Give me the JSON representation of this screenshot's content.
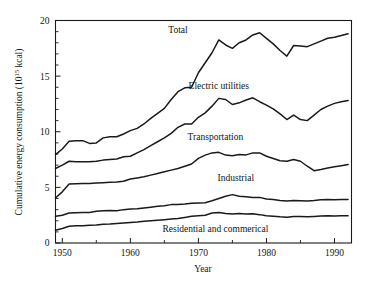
{
  "chart_data": {
    "type": "line",
    "title": "",
    "subtitle": "",
    "xlabel": "Year",
    "ylabel": "Cumulative energy consumption (10",
    "ylabel_exponent": "15",
    "ylabel_suffix": " kcal)",
    "ylabel_full": "Cumulative energy consumption (10^15 kcal)",
    "xlim": [
      1949,
      1992.5
    ],
    "ylim": [
      0,
      20
    ],
    "xticks": [
      1950,
      1960,
      1970,
      1980,
      1990
    ],
    "xtick_labels": [
      "1950",
      "1960",
      "1970",
      "1980",
      "1990"
    ],
    "xticks_minor": [
      1955,
      1965,
      1975,
      1985
    ],
    "yticks": [
      0,
      5,
      10,
      15,
      20
    ],
    "ytick_labels": [
      "0",
      "5",
      "10",
      "15",
      "20"
    ],
    "yticks_minor": [
      1,
      2,
      3,
      4,
      6,
      7,
      8,
      9,
      11,
      12,
      13,
      14,
      16,
      17,
      18,
      19
    ],
    "grid": false,
    "legend_position": "inline-annotations",
    "stacking": "cumulative",
    "line_color": "#1a1a1a",
    "x": [
      1949,
      1950,
      1951,
      1952,
      1953,
      1954,
      1955,
      1956,
      1957,
      1958,
      1959,
      1960,
      1961,
      1962,
      1963,
      1964,
      1965,
      1966,
      1967,
      1968,
      1969,
      1970,
      1971,
      1972,
      1973,
      1974,
      1975,
      1976,
      1977,
      1978,
      1979,
      1980,
      1981,
      1982,
      1983,
      1984,
      1985,
      1986,
      1987,
      1988,
      1989,
      1990,
      1991,
      1992
    ],
    "series": [
      {
        "name": "Residential and commerical",
        "label": "Residential and commerical",
        "label_x": 1972.5,
        "label_y": 1.0,
        "values": [
          1.15,
          1.3,
          1.5,
          1.55,
          1.55,
          1.6,
          1.62,
          1.68,
          1.7,
          1.75,
          1.8,
          1.85,
          1.88,
          1.95,
          2.0,
          2.05,
          2.1,
          2.15,
          2.2,
          2.3,
          2.4,
          2.45,
          2.5,
          2.7,
          2.75,
          2.65,
          2.6,
          2.65,
          2.6,
          2.62,
          2.55,
          2.45,
          2.4,
          2.35,
          2.32,
          2.38,
          2.38,
          2.35,
          2.38,
          2.42,
          2.45,
          2.42,
          2.45,
          2.45
        ]
      },
      {
        "name": "Industrial",
        "label": "Industrial",
        "label_x": 1975.5,
        "label_y": 5.6,
        "values": [
          2.4,
          2.5,
          2.7,
          2.72,
          2.75,
          2.75,
          2.85,
          2.9,
          2.92,
          2.9,
          3.0,
          3.05,
          3.08,
          3.15,
          3.22,
          3.3,
          3.35,
          3.45,
          3.45,
          3.5,
          3.58,
          3.6,
          3.62,
          3.8,
          4.0,
          4.2,
          4.35,
          4.2,
          4.15,
          4.1,
          4.1,
          3.95,
          3.9,
          3.82,
          3.78,
          3.82,
          3.8,
          3.78,
          3.82,
          3.88,
          3.9,
          3.88,
          3.9,
          3.92
        ]
      },
      {
        "name": "Transportation",
        "label": "Transportation",
        "label_x": 1972.5,
        "label_y": 9.3,
        "values": [
          4.05,
          4.6,
          5.3,
          5.32,
          5.35,
          5.35,
          5.4,
          5.42,
          5.45,
          5.48,
          5.55,
          5.75,
          5.85,
          5.95,
          6.1,
          6.25,
          6.4,
          6.55,
          6.7,
          6.9,
          7.1,
          7.6,
          7.9,
          8.1,
          8.15,
          7.9,
          7.85,
          7.95,
          7.92,
          8.1,
          8.1,
          7.8,
          7.6,
          7.4,
          7.35,
          7.5,
          7.35,
          6.9,
          6.5,
          6.6,
          6.75,
          6.85,
          6.95,
          7.05
        ]
      },
      {
        "name": "Electric utilities",
        "label": "Electric utilities",
        "label_x": 1973.0,
        "label_y": 13.8,
        "values": [
          6.7,
          7.0,
          7.35,
          7.3,
          7.3,
          7.3,
          7.35,
          7.45,
          7.5,
          7.55,
          7.75,
          7.8,
          8.1,
          8.4,
          8.75,
          9.1,
          9.45,
          9.85,
          10.4,
          10.7,
          10.7,
          11.3,
          11.7,
          12.3,
          13.0,
          12.9,
          12.45,
          12.6,
          12.85,
          13.05,
          12.7,
          12.4,
          12.05,
          11.6,
          11.1,
          11.5,
          11.1,
          11.0,
          11.5,
          12.0,
          12.3,
          12.55,
          12.7,
          12.8
        ]
      },
      {
        "name": "Total",
        "label": "Total",
        "label_x": 1967.0,
        "label_y": 18.9,
        "values": [
          7.95,
          8.45,
          9.15,
          9.2,
          9.2,
          8.95,
          9.0,
          9.45,
          9.55,
          9.55,
          9.8,
          10.1,
          10.3,
          10.7,
          11.2,
          11.65,
          12.1,
          12.9,
          13.6,
          13.95,
          14.0,
          15.3,
          16.2,
          17.1,
          18.25,
          17.8,
          17.5,
          18.0,
          18.25,
          18.7,
          18.9,
          18.4,
          17.9,
          17.3,
          16.8,
          17.75,
          17.7,
          17.65,
          17.9,
          18.15,
          18.4,
          18.5,
          18.65,
          18.8
        ]
      }
    ]
  }
}
